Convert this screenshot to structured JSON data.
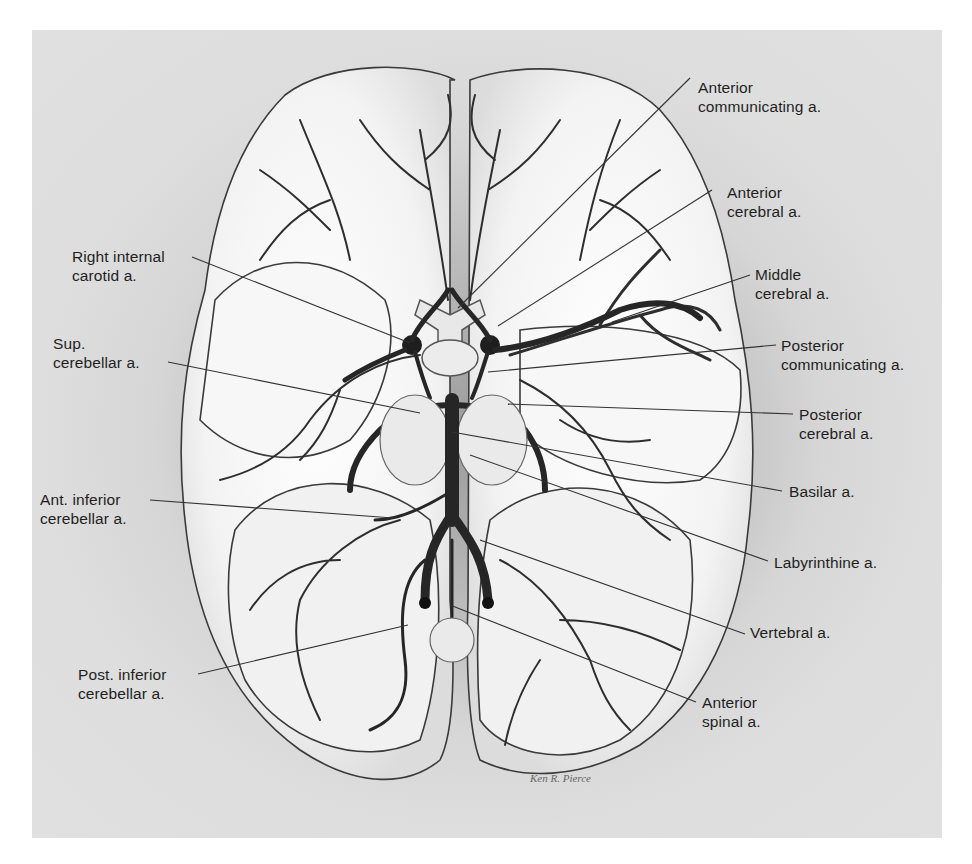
{
  "figure": {
    "signature": "Ken R. Pierce",
    "colors": {
      "panel_bg": "#d9d9d9",
      "brain_fill": "#f4f4f4",
      "vessel": "#2b2b2b",
      "leader_line": "#333333",
      "label_text": "#1f1f1f"
    }
  },
  "labels": {
    "right": [
      {
        "id": "anterior-communicating",
        "line1": "Anterior",
        "line2": "communicating a."
      },
      {
        "id": "anterior-cerebral",
        "line1": "Anterior",
        "line2": "cerebral a."
      },
      {
        "id": "middle-cerebral",
        "line1": "Middle",
        "line2": "cerebral a."
      },
      {
        "id": "posterior-communicating",
        "line1": "Posterior",
        "line2": "communicating a."
      },
      {
        "id": "posterior-cerebral",
        "line1": "Posterior",
        "line2": "cerebral a."
      },
      {
        "id": "basilar",
        "line1": "Basilar a.",
        "line2": ""
      },
      {
        "id": "labyrinthine",
        "line1": "Labyrinthine a.",
        "line2": ""
      },
      {
        "id": "vertebral",
        "line1": "Vertebral a.",
        "line2": ""
      },
      {
        "id": "anterior-spinal",
        "line1": "Anterior",
        "line2": "spinal a."
      }
    ],
    "left": [
      {
        "id": "right-internal-carotid",
        "line1": "Right internal",
        "line2": "carotid a."
      },
      {
        "id": "sup-cerebellar",
        "line1": "Sup.",
        "line2": "cerebellar a."
      },
      {
        "id": "ant-inferior-cerebellar",
        "line1": "Ant. inferior",
        "line2": "cerebellar a."
      },
      {
        "id": "post-inferior-cerebellar",
        "line1": "Post. inferior",
        "line2": "cerebellar a."
      }
    ]
  }
}
